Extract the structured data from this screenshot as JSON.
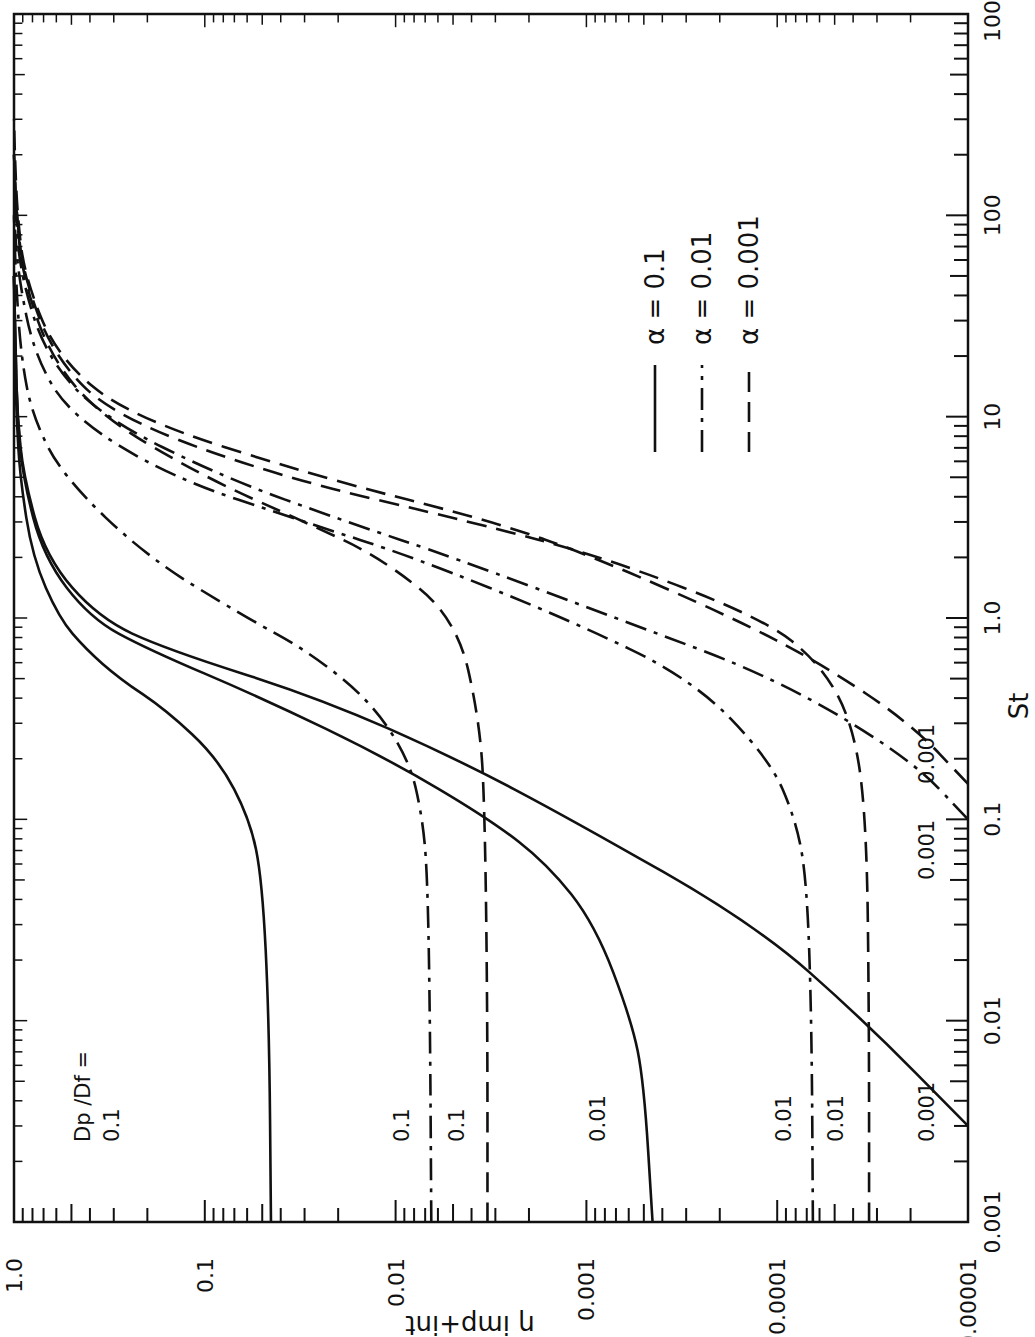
{
  "chart_data": {
    "type": "line",
    "orientation": "rotated-90-ccw",
    "title": "",
    "xlabel": "St",
    "ylabel": "η imp+int",
    "xscale": "log",
    "yscale": "log",
    "xlim": [
      0.001,
      1000
    ],
    "ylim": [
      1e-05,
      1.0
    ],
    "x_ticks": [
      "0.001",
      "0.01",
      "0.1",
      "1.0",
      "10",
      "100",
      "1000"
    ],
    "y_ticks": [
      "0.00001",
      "0.0001",
      "0.001",
      "0.01",
      "0.1",
      "1.0"
    ],
    "grid": false,
    "legend_position": "upper-middle",
    "legend": [
      {
        "label": "α = 0.1",
        "style": "solid"
      },
      {
        "label": "α = 0.01",
        "style": "dash-dot"
      },
      {
        "label": "α = 0.001",
        "style": "dashed"
      }
    ],
    "annotation_header": "Dp /Df =",
    "series": [
      {
        "name": "α=0.1, Dp/Df=0.1",
        "style": "solid",
        "label": "0.1",
        "x": [
          0.001,
          0.01,
          0.05,
          0.1,
          0.2,
          0.35,
          0.5,
          0.7,
          1.0,
          2.0,
          5.0,
          10,
          20,
          50
        ],
        "y": [
          0.045,
          0.046,
          0.05,
          0.058,
          0.085,
          0.16,
          0.28,
          0.42,
          0.58,
          0.8,
          0.93,
          0.97,
          0.99,
          1.0
        ]
      },
      {
        "name": "α=0.1, Dp/Df=0.01",
        "style": "solid",
        "label": "0.01",
        "x": [
          0.001,
          0.005,
          0.01,
          0.03,
          0.06,
          0.1,
          0.2,
          0.4,
          0.7,
          1.0,
          2.0,
          5.0,
          10,
          20,
          50
        ],
        "y": [
          0.00045,
          0.0005,
          0.00058,
          0.0009,
          0.0016,
          0.0032,
          0.011,
          0.05,
          0.2,
          0.4,
          0.7,
          0.9,
          0.96,
          0.98,
          1.0
        ]
      },
      {
        "name": "α=0.1, Dp/Df=0.001",
        "style": "solid",
        "label": "0.001",
        "x": [
          0.003,
          0.01,
          0.03,
          0.1,
          0.2,
          0.4,
          0.7,
          1.0,
          2.0,
          5.0,
          10,
          20,
          50
        ],
        "y": [
          1e-05,
          3.5e-05,
          0.00013,
          0.0012,
          0.0048,
          0.025,
          0.16,
          0.36,
          0.68,
          0.89,
          0.96,
          0.98,
          1.0
        ]
      },
      {
        "name": "α=0.01, Dp/Df=0.1",
        "style": "dash-dot",
        "label": "0.1",
        "x": [
          0.001,
          0.01,
          0.05,
          0.1,
          0.2,
          0.4,
          0.7,
          1.0,
          2.0,
          5.0,
          10,
          20,
          50,
          100
        ],
        "y": [
          0.0065,
          0.0066,
          0.0068,
          0.0072,
          0.0085,
          0.014,
          0.03,
          0.06,
          0.2,
          0.55,
          0.8,
          0.92,
          0.98,
          1.0
        ]
      },
      {
        "name": "α=0.01, Dp/Df=0.01",
        "style": "dash-dot",
        "label": "0.01",
        "x": [
          0.001,
          0.01,
          0.05,
          0.1,
          0.2,
          0.5,
          1.0,
          2.0,
          3.0,
          5.0,
          10,
          20,
          50,
          100
        ],
        "y": [
          6.5e-05,
          6.6e-05,
          7e-05,
          8e-05,
          0.00011,
          0.00028,
          0.0013,
          0.008,
          0.03,
          0.15,
          0.5,
          0.78,
          0.95,
          1.0
        ]
      },
      {
        "name": "α=0.01, Dp/Df=0.001",
        "style": "dash-dot",
        "label": "0.001",
        "x": [
          0.1,
          0.2,
          0.5,
          1.0,
          2.0,
          3.0,
          5.0,
          10,
          20,
          50,
          100,
          200
        ],
        "y": [
          1e-05,
          2e-05,
          0.0001,
          0.0007,
          0.005,
          0.018,
          0.08,
          0.35,
          0.68,
          0.92,
          0.98,
          1.0
        ]
      },
      {
        "name": "α=0.001, Dp/Df=0.1",
        "style": "dashed",
        "label": "0.1",
        "x": [
          0.001,
          0.01,
          0.1,
          0.3,
          1.0,
          2.0,
          3.0,
          5.0,
          10,
          20,
          50,
          100,
          200
        ],
        "y": [
          0.0033,
          0.0033,
          0.0034,
          0.0036,
          0.0048,
          0.012,
          0.03,
          0.1,
          0.35,
          0.65,
          0.9,
          0.97,
          1.0
        ]
      },
      {
        "name": "α=0.001, Dp/Df=0.01",
        "style": "dashed",
        "label": "0.01",
        "x": [
          0.001,
          0.01,
          0.1,
          0.3,
          0.6,
          1.0,
          2.0,
          3.0,
          5.0,
          10,
          20,
          50,
          100,
          200
        ],
        "y": [
          3.3e-05,
          3.3e-05,
          3.4e-05,
          4e-05,
          6e-05,
          0.00012,
          0.0008,
          0.004,
          0.04,
          0.3,
          0.62,
          0.89,
          0.97,
          1.0
        ]
      },
      {
        "name": "α=0.001, Dp/Df=0.001",
        "style": "dashed",
        "label": "0.001",
        "x": [
          0.15,
          0.3,
          0.6,
          1.0,
          2.0,
          3.0,
          5.0,
          10,
          20,
          50,
          100,
          200,
          300
        ],
        "y": [
          1e-05,
          2e-05,
          6e-05,
          0.00017,
          0.0009,
          0.003,
          0.025,
          0.25,
          0.6,
          0.88,
          0.96,
          0.99,
          1.0
        ]
      }
    ],
    "annotations": [
      {
        "text": "Dp /Df =",
        "x": 0.0025,
        "y": 0.4
      },
      {
        "text": "0.1",
        "x": 0.0025,
        "y": 0.28
      },
      {
        "text": "0.1",
        "x": 0.0025,
        "y": 0.0085
      },
      {
        "text": "0.1",
        "x": 0.0025,
        "y": 0.0044
      },
      {
        "text": "0.01",
        "x": 0.0025,
        "y": 0.0008
      },
      {
        "text": "0.01",
        "x": 0.0025,
        "y": 8.5e-05
      },
      {
        "text": "0.01",
        "x": 0.0025,
        "y": 4.5e-05
      },
      {
        "text": "0.001",
        "x": 0.0025,
        "y": 1.5e-05
      },
      {
        "text": "0.001",
        "x": 0.05,
        "y": 1.5e-05
      },
      {
        "text": "0.001",
        "x": 0.15,
        "y": 1.5e-05
      }
    ]
  },
  "labels": {
    "legend_alpha_01": "α = 0.1",
    "legend_alpha_001": "α = 0.01",
    "legend_alpha_0001": "α = 0.001",
    "x_axis_title": "St",
    "y_axis_title": "η imp+int"
  }
}
